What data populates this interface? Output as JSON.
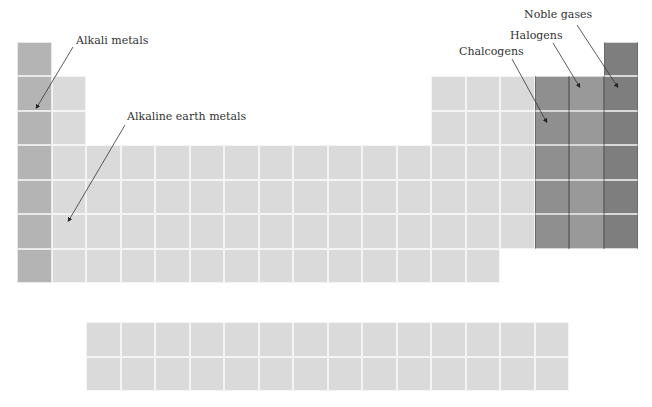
{
  "labels": {
    "alkali": "Alkali metals",
    "alkaline_earth": "Alkaline earth metals",
    "chalcogens": "Chalcogens",
    "halogens": "Halogens",
    "noble_gases": "Noble gases"
  },
  "colors": {
    "alkali": "#b4b4b4",
    "light": "#dadada",
    "chalcogens": "#8f8f8f",
    "halogens": "#999999",
    "noble_gases": "#7e7e7e"
  },
  "grid": {
    "main_table": {
      "columns": 18,
      "rows": 7
    },
    "f_block": {
      "columns": 14,
      "rows": 2
    }
  }
}
